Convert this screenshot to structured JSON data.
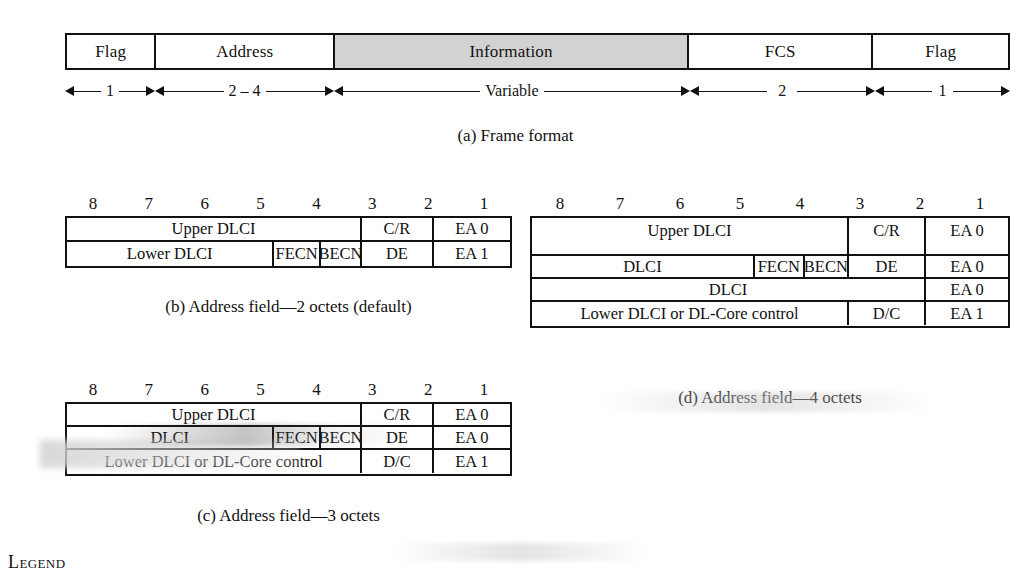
{
  "figure_a": {
    "caption": "(a) Frame format",
    "fields": [
      {
        "label": "Flag",
        "octets": "1",
        "shaded": false,
        "width_pct": 9.5
      },
      {
        "label": "Address",
        "octets": "2 – 4",
        "shaded": false,
        "width_pct": 19.0
      },
      {
        "label": "Information",
        "octets": "Variable",
        "shaded": true,
        "width_pct": 37.6
      },
      {
        "label": "FCS",
        "octets": "2",
        "shaded": false,
        "width_pct": 19.6
      },
      {
        "label": "Flag",
        "octets": "1",
        "shaded": false,
        "width_pct": 14.3
      }
    ]
  },
  "bit_numbers": [
    "8",
    "7",
    "6",
    "5",
    "4",
    "3",
    "2",
    "1"
  ],
  "figure_b": {
    "caption": "(b) Address field—2 octets (default)",
    "rows": [
      [
        {
          "label": "Upper DLCI",
          "width_pct": 66.6
        },
        {
          "label": "C/R",
          "width_pct": 16.2
        },
        {
          "label": "EA 0",
          "width_pct": 17.2
        }
      ],
      [
        {
          "label": "Lower DLCI",
          "width_pct": 46.8
        },
        {
          "label": "FECN",
          "width_pct": 10.5
        },
        {
          "label": "BECN",
          "width_pct": 9.3
        },
        {
          "label": "DE",
          "width_pct": 16.2
        },
        {
          "label": "EA 1",
          "width_pct": 17.2
        }
      ]
    ]
  },
  "figure_c": {
    "caption": "(c) Address field—3 octets",
    "rows": [
      [
        {
          "label": "Upper DLCI",
          "width_pct": 66.6
        },
        {
          "label": "C/R",
          "width_pct": 16.2
        },
        {
          "label": "EA 0",
          "width_pct": 17.2
        }
      ],
      [
        {
          "label": "DLCI",
          "width_pct": 46.8
        },
        {
          "label": "FECN",
          "width_pct": 10.5
        },
        {
          "label": "BECN",
          "width_pct": 9.3
        },
        {
          "label": "DE",
          "width_pct": 16.2
        },
        {
          "label": "EA 0",
          "width_pct": 17.2
        }
      ],
      [
        {
          "label": "Lower DLCI or DL-Core control",
          "width_pct": 66.6
        },
        {
          "label": "D/C",
          "width_pct": 16.2
        },
        {
          "label": "EA 1",
          "width_pct": 17.2
        }
      ]
    ]
  },
  "figure_d": {
    "caption": "(d) Address field—4 octets",
    "rows": [
      [
        {
          "label": "Upper DLCI",
          "width_pct": 66.6
        },
        {
          "label": "C/R",
          "width_pct": 16.2
        },
        {
          "label": "EA 0",
          "width_pct": 17.2
        }
      ],
      [
        {
          "label": "DLCI",
          "width_pct": 46.8
        },
        {
          "label": "FECN",
          "width_pct": 10.5
        },
        {
          "label": "BECN",
          "width_pct": 9.3
        },
        {
          "label": "DE",
          "width_pct": 16.2
        },
        {
          "label": "EA 0",
          "width_pct": 17.2
        }
      ],
      [
        {
          "label": "DLCI",
          "width_pct": 82.8
        },
        {
          "label": "EA 0",
          "width_pct": 17.2
        }
      ],
      [
        {
          "label": "Lower DLCI or DL-Core control",
          "width_pct": 66.6
        },
        {
          "label": "D/C",
          "width_pct": 16.2
        },
        {
          "label": "EA 1",
          "width_pct": 17.2
        }
      ]
    ]
  },
  "legend": {
    "heading": "Legend"
  },
  "colors": {
    "ink": "#111111",
    "paper": "#ffffff",
    "shaded_field": "#d2d2d2"
  }
}
